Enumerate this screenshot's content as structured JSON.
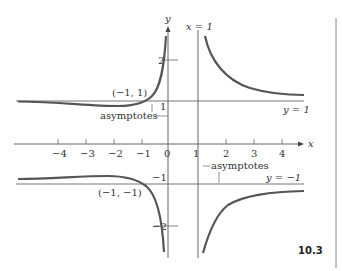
{
  "figure": {
    "number": "10.3",
    "axis_x_label": "x",
    "axis_y_label": "y",
    "vertical_asymptote_label": "x = 1",
    "asymptote_y1_label": "y = 1",
    "asymptote_ym1_label": "y = −1",
    "asymptotes_label_upper": "asymptotes",
    "asymptotes_label_lower": "asymptotes",
    "point_upper": "(−1, 1)",
    "point_lower": "(−1, −1)",
    "x_ticks": [
      "−4",
      "−3",
      "−2",
      "−1",
      "0",
      "1",
      "2",
      "3",
      "4"
    ],
    "y_tick_2": "2",
    "y_tick_1": "1",
    "y_tick_m1": "−1",
    "y_tick_m2": "−2"
  },
  "colors": {
    "curve": "#555555",
    "axes": "#666666",
    "text": "#333333"
  }
}
